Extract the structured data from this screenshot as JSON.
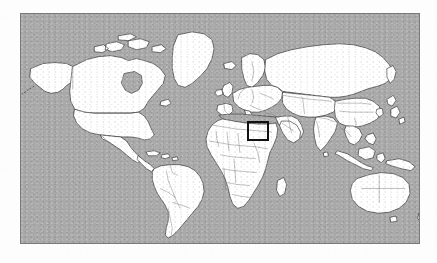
{
  "figure": {
    "kind": "world-locator-map",
    "caption": "",
    "background_color": "#fdfdfd"
  },
  "map": {
    "title": "",
    "projection": "equirectangular",
    "frame": {
      "x": 20,
      "y": 13,
      "width": 400,
      "height": 231,
      "border_color": "#7a7a7a",
      "border_width": 1
    },
    "ocean_color": "#a9a9a9",
    "land_color": "#ffffff",
    "coastline_color": "#3a3a3a",
    "border_color": "#6e6e6e",
    "lon_range": [
      -180,
      180
    ],
    "lat_range": [
      -60,
      84
    ],
    "graticule": false,
    "labels": []
  },
  "highlight": {
    "name": "eastern-mediterranean-levant",
    "label": "",
    "stroke_color": "#111111",
    "stroke_width": 2,
    "fill": "none",
    "pixel_box": {
      "x": 247,
      "y": 121,
      "width": 22,
      "height": 20
    },
    "lon_range": [
      28,
      48
    ],
    "lat_range": [
      24,
      42
    ]
  },
  "regions": [
    {
      "name": "north-america"
    },
    {
      "name": "greenland"
    },
    {
      "name": "south-america"
    },
    {
      "name": "europe"
    },
    {
      "name": "africa"
    },
    {
      "name": "asia"
    },
    {
      "name": "australia"
    },
    {
      "name": "new-zealand"
    },
    {
      "name": "japan"
    },
    {
      "name": "indonesia"
    },
    {
      "name": "madagascar"
    },
    {
      "name": "iceland"
    },
    {
      "name": "british-isles"
    }
  ]
}
